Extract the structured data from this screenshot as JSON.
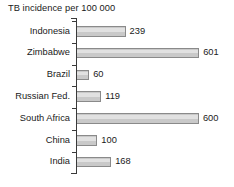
{
  "chart_data": {
    "type": "bar",
    "orientation": "horizontal",
    "title": "TB incidence per 100 000",
    "xlabel": "",
    "ylabel": "",
    "xlim": [
      0,
      620
    ],
    "grid": false,
    "legend": null,
    "value_labels": true,
    "categories": [
      "Indonesia",
      "Zimbabwe",
      "Brazil",
      "Russian Fed.",
      "South Africa",
      "China",
      "India"
    ],
    "values": [
      239,
      601,
      60,
      119,
      600,
      100,
      168
    ],
    "bars": [
      {
        "category": "Indonesia",
        "value": 239,
        "label": "239"
      },
      {
        "category": "Zimbabwe",
        "value": 601,
        "label": "601"
      },
      {
        "category": "Brazil",
        "value": 60,
        "label": "60"
      },
      {
        "category": "Russian Fed.",
        "value": 119,
        "label": "119"
      },
      {
        "category": "South Africa",
        "value": 600,
        "label": "600"
      },
      {
        "category": "China",
        "value": 100,
        "label": "100"
      },
      {
        "category": "India",
        "value": 168,
        "label": "168"
      }
    ],
    "colors": {
      "bar_fill": "#c9c9c9",
      "bar_border": "#8a8a8a",
      "axis": "#3a3a3a",
      "text": "#1a1a1a",
      "background": "#ffffff"
    }
  }
}
